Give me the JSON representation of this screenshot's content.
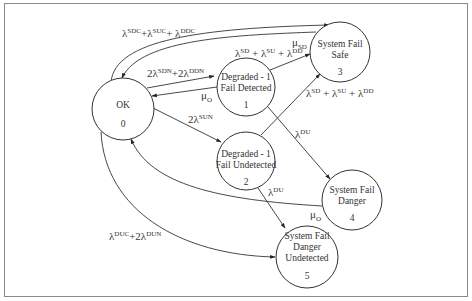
{
  "diagram": {
    "type": "markov-state-transition",
    "nodes": [
      {
        "id": "0",
        "line1": "OK",
        "line2": "",
        "number": "0"
      },
      {
        "id": "1",
        "line1": "Degraded - 1",
        "line2": "Fail Detected",
        "number": "1"
      },
      {
        "id": "2",
        "line1": "Degraded - 1",
        "line2": "Fail Undetected",
        "number": "2"
      },
      {
        "id": "3",
        "line1": "System Fail",
        "line2": "Safe",
        "number": "3"
      },
      {
        "id": "4",
        "line1": "System Fail",
        "line2": "Danger",
        "number": "4"
      },
      {
        "id": "5",
        "line1": "System Fail",
        "line2": "Danger",
        "line3": "Undetected",
        "number": "5"
      }
    ],
    "edges": [
      {
        "from": "0",
        "to": "3",
        "label": {
          "a": "λ",
          "a_sup": "SDC",
          "b": "+λ",
          "b_sup": "SUC",
          "c": "+ λ",
          "c_sup": "DDC"
        }
      },
      {
        "from": "3",
        "to": "0",
        "label": {
          "mu": "μ",
          "mu_sub": "SD"
        }
      },
      {
        "from": "0",
        "to": "1",
        "label": {
          "a": "2λ",
          "a_sup": "SDN",
          "b": "+2λ",
          "b_sup": "DDN"
        }
      },
      {
        "from": "1",
        "to": "0",
        "label": {
          "mu": "μ",
          "mu_sub": "O"
        }
      },
      {
        "from": "1",
        "to": "3",
        "label": {
          "a": "λ",
          "a_sup": "SD",
          "b": " + λ",
          "b_sup": "SU",
          "c": " + λ",
          "c_sup": "DD"
        }
      },
      {
        "from": "0",
        "to": "2",
        "label": {
          "a": "2λ",
          "a_sup": "SUN"
        }
      },
      {
        "from": "2",
        "to": "3",
        "label": {
          "a": "λ",
          "a_sup": "SD",
          "b": " + λ",
          "b_sup": "SU",
          "c": " + λ",
          "c_sup": "DD"
        }
      },
      {
        "from": "1",
        "to": "4",
        "label": {
          "a": "λ",
          "a_sup": "DU"
        }
      },
      {
        "from": "2",
        "to": "5",
        "label": {
          "a": "λ",
          "a_sup": "DU"
        }
      },
      {
        "from": "4",
        "to": "0",
        "label": {
          "mu": "μ",
          "mu_sub": "O"
        }
      },
      {
        "from": "0",
        "to": "5",
        "label": {
          "a": "λ",
          "a_sup": "DUC",
          "b": "+2λ",
          "b_sup": "DUN"
        }
      }
    ]
  }
}
